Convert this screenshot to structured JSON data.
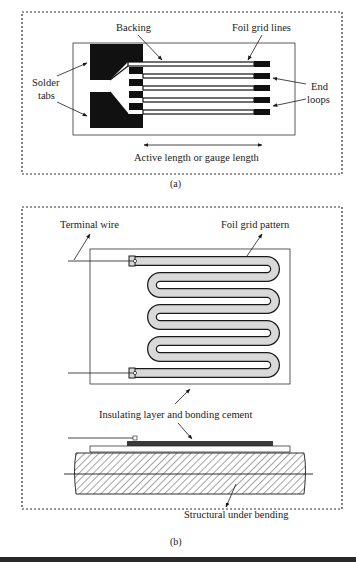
{
  "figure_a": {
    "caption": "(a)",
    "labels": {
      "backing": "Backing",
      "foil_grid_lines": "Foil grid lines",
      "solder_tabs_line1": "Solder",
      "solder_tabs_line2": "tabs",
      "end_loops_line1": "End",
      "end_loops_line2": "loops",
      "active_length": "Active length or gauge length"
    }
  },
  "figure_b": {
    "caption": "(b)",
    "labels": {
      "terminal_wire": "Terminal wire",
      "foil_grid_pattern": "Foil grid pattern",
      "insulating_layer": "Insulating layer and bonding cement",
      "structural": "Structural under bending"
    }
  },
  "colors": {
    "ink": "#1a1a1a",
    "foil_fill": "#d9d9d9",
    "border_dots": "#333333"
  }
}
